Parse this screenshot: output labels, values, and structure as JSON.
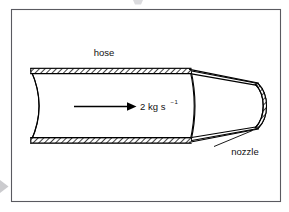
{
  "figure": {
    "background_color": "#ffffff",
    "frame_color": "#5a5a60",
    "line_color": "#000000"
  },
  "labels": {
    "hose": "hose",
    "nozzle": "nozzle"
  },
  "flow": {
    "value": "2",
    "unit_main": "kg s",
    "unit_exponent": "1",
    "exponent_sign": "−",
    "full_text": "2 kg s⁻¹",
    "direction": "left-to-right"
  },
  "parts": {
    "hose_name": "hose",
    "nozzle_name": "nozzle",
    "wall_pattern": "diagonal-hatch"
  }
}
